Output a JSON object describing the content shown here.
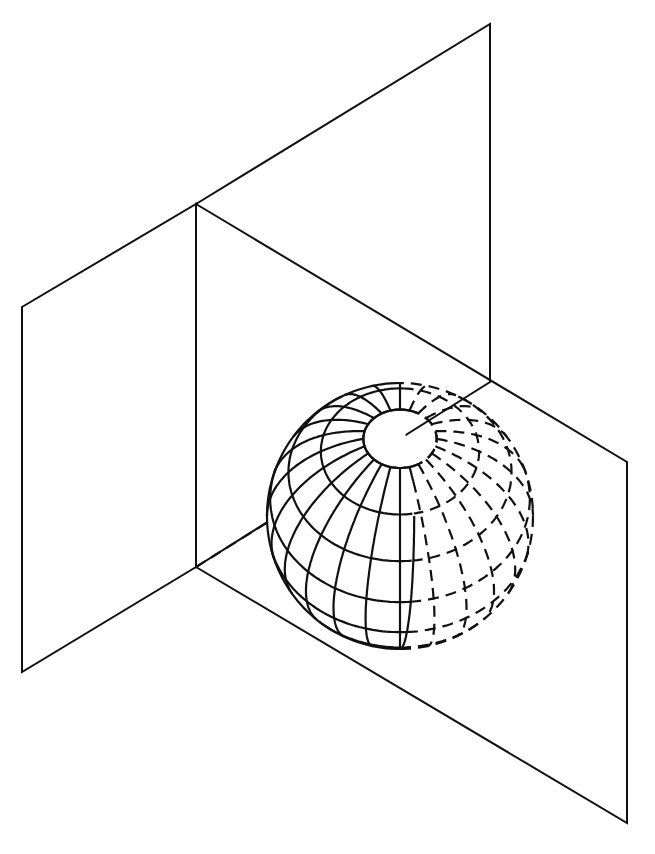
{
  "diagram": {
    "type": "geometry-illustration",
    "colors": {
      "background": "#ffffff",
      "shaded_plane": "#e2e2e2",
      "line": "#111111",
      "sphere_fill": "#ffffff"
    },
    "planes": [
      {
        "name": "back-vertical-plane",
        "shaded": false,
        "corners": [
          [
            196,
            204
          ],
          [
            490,
            24
          ],
          [
            490,
            382
          ],
          [
            196,
            567
          ]
        ]
      },
      {
        "name": "left-plane",
        "shaded": false,
        "corners": [
          [
            22,
            307
          ],
          [
            196,
            204
          ],
          [
            196,
            567
          ],
          [
            22,
            672
          ]
        ]
      },
      {
        "name": "shaded-plane",
        "shaded": true,
        "corners": [
          [
            196,
            204
          ],
          [
            627,
            462
          ],
          [
            627,
            823
          ],
          [
            196,
            567
          ]
        ]
      }
    ],
    "sphere": {
      "center": [
        400,
        516
      ],
      "radius": 133,
      "meridian_count": 24,
      "parallel_count": 8,
      "pole": [
        400,
        410
      ],
      "hidden_lines_style": "dashed"
    },
    "hidden_edge": {
      "from": [
        196,
        567
      ],
      "to": [
        268,
        522
      ],
      "style": "dashed"
    }
  }
}
